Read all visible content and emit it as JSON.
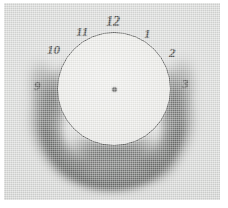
{
  "figure": {
    "caption": "",
    "plate_background": "#d7d8d6",
    "dial_fill": "#e9e9e5",
    "ink_color": "#2e2f2d",
    "smudge_color": "#4a4c4a"
  },
  "dial": {
    "centre_dot_label": "",
    "hours": [
      {
        "id": "hour-10",
        "label": "10",
        "obscured": false
      },
      {
        "id": "hour-11",
        "label": "11",
        "obscured": false
      },
      {
        "id": "hour-12",
        "label": "12",
        "obscured": false
      },
      {
        "id": "hour-1",
        "label": "1",
        "obscured": false
      },
      {
        "id": "hour-2",
        "label": "2",
        "obscured": false
      },
      {
        "id": "hour-9",
        "label": "9",
        "obscured": true
      },
      {
        "id": "hour-3",
        "label": "3",
        "obscured": true
      }
    ]
  }
}
